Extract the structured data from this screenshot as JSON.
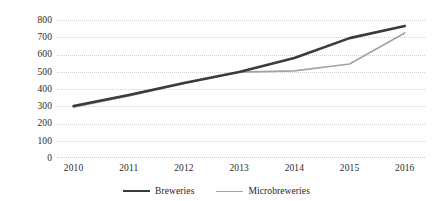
{
  "chart_data": {
    "type": "line",
    "title": "",
    "subtitle": "",
    "xlabel": "",
    "ylabel": "",
    "categories": [
      "2010",
      "2011",
      "2012",
      "2013",
      "2014",
      "2015",
      "2016"
    ],
    "x": [
      2010,
      2011,
      2012,
      2013,
      2014,
      2015,
      2016
    ],
    "series": [
      {
        "name": "Breweries",
        "color": "#3b3b3b",
        "line_width": 2.6,
        "values": [
          301,
          365,
          435,
          498,
          580,
          695,
          765
        ]
      },
      {
        "name": "Microbreweries",
        "color": "#a3a3a3",
        "line_width": 1.6,
        "values": [
          295,
          360,
          432,
          498,
          505,
          545,
          725
        ]
      }
    ],
    "ylim": [
      0,
      800
    ],
    "ytick_step": 100,
    "ytick_labels": [
      "800",
      "700",
      "600",
      "500",
      "400",
      "300",
      "200",
      "100",
      "0"
    ],
    "ytick_values": [
      800,
      700,
      600,
      500,
      400,
      300,
      200,
      100,
      0
    ],
    "grid": true,
    "grid_axis": "y",
    "grid_color": "#d2d2d2",
    "legend": true,
    "legend_position": "bottom-center",
    "legend_entries": [
      "Breweries",
      "Microbreweries"
    ],
    "markers": false,
    "background": "#ffffff"
  }
}
